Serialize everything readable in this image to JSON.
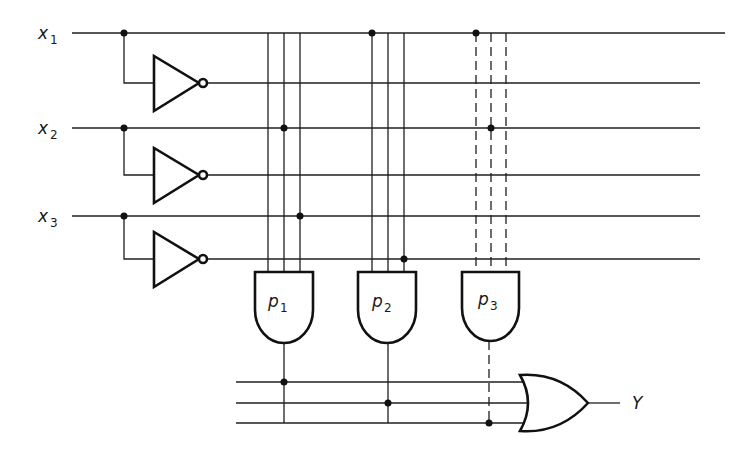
{
  "diagram": {
    "type": "programmable-logic-array",
    "inputs": [
      {
        "name": "x",
        "sub": "1",
        "y": 33,
        "inv_y": 83
      },
      {
        "name": "x",
        "sub": "2",
        "y": 128,
        "inv_y": 175
      },
      {
        "name": "x",
        "sub": "3",
        "y": 216,
        "inv_y": 259
      }
    ],
    "and_gates": [
      {
        "name": "p",
        "sub": "1",
        "style": "solid",
        "columns": [
          268,
          284,
          300
        ],
        "connections": [
          "x1'",
          "x2",
          "x3"
        ]
      },
      {
        "name": "p",
        "sub": "2",
        "style": "solid",
        "columns": [
          372,
          388,
          404
        ],
        "connections": [
          "x1",
          "x3'"
        ]
      },
      {
        "name": "p",
        "sub": "3",
        "style": "dashed",
        "columns": [
          476,
          490,
          506
        ],
        "connections": [
          "x1",
          "x2"
        ]
      }
    ],
    "or_gate": {
      "inputs": [
        "p1",
        "p2",
        "p3"
      ],
      "bus_y": [
        382,
        403,
        423
      ],
      "output_label": "Y"
    },
    "colors": {
      "ink": "#1f1f1f",
      "background": "#ffffff"
    }
  }
}
